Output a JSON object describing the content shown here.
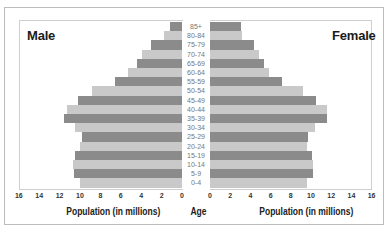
{
  "titles": {
    "male": "Male",
    "female": "Female"
  },
  "axis": {
    "left_title": "Population (in millions)",
    "center_title": "Age",
    "right_title": "Population (in millions)",
    "left_ticks": [
      "16",
      "14",
      "12",
      "10",
      "8",
      "6",
      "4",
      "2",
      "0"
    ],
    "right_ticks": [
      "0",
      "2",
      "4",
      "6",
      "8",
      "10",
      "12",
      "14",
      "16"
    ]
  },
  "colors": {
    "dark_bar": "#8b8b8b",
    "light_bar": "#c9c9c9"
  },
  "chart_data": {
    "type": "bar",
    "subtype": "population pyramid (horizontal, mirrored)",
    "title": "",
    "categories": [
      "85+",
      "80-84",
      "75-79",
      "70-74",
      "65-69",
      "60-64",
      "55-59",
      "50-54",
      "45-49",
      "40-44",
      "35-39",
      "30-34",
      "25-29",
      "20-24",
      "15-19",
      "10-14",
      "5-9",
      "0-4"
    ],
    "series": [
      {
        "name": "Male",
        "values": [
          1.2,
          1.8,
          3.0,
          3.9,
          4.4,
          5.3,
          6.6,
          8.8,
          10.2,
          11.3,
          11.6,
          10.5,
          9.8,
          10.0,
          10.5,
          10.7,
          10.6,
          10.0
        ]
      },
      {
        "name": "Female",
        "values": [
          3.1,
          3.2,
          4.4,
          4.9,
          5.3,
          5.8,
          7.1,
          9.2,
          10.5,
          11.6,
          11.6,
          10.4,
          9.7,
          9.6,
          10.1,
          10.2,
          10.2,
          9.6
        ]
      }
    ],
    "xlabel_left": "Population (in millions)",
    "xlabel_right": "Population (in millions)",
    "center_label": "Age",
    "xlim": [
      0,
      16
    ],
    "xticks": [
      0,
      2,
      4,
      6,
      8,
      10,
      12,
      14,
      16
    ],
    "grid": false,
    "legend": "side titles: 'Male' top-left, 'Female' top-right"
  }
}
